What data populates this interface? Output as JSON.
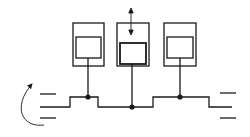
{
  "diagram": {
    "stroke_color": "#1a1a1a",
    "background": "#ffffff",
    "units": [
      {
        "name": "unit-left",
        "outer": {
          "x": 73,
          "y": 23,
          "w": 31,
          "h": 43
        },
        "inner": {
          "x": 76,
          "y": 37,
          "w": 25,
          "h": 21
        },
        "stem_x": 88,
        "junction_y": 97
      },
      {
        "name": "unit-middle",
        "outer": {
          "x": 117,
          "y": 23,
          "w": 32,
          "h": 43
        },
        "inner": {
          "x": 120,
          "y": 43,
          "w": 26,
          "h": 21
        },
        "stem_x": 132,
        "junction_y": 107
      },
      {
        "name": "unit-right",
        "outer": {
          "x": 164,
          "y": 23,
          "w": 32,
          "h": 43
        },
        "inner": {
          "x": 167,
          "y": 37,
          "w": 26,
          "h": 21
        },
        "stem_x": 180,
        "junction_y": 97
      }
    ],
    "bus_path": "M40,107 L70,107 L70,97 L98,97 L98,107 L153,107 L153,97 L209,97 L209,107 L232,107",
    "vertical_arrow": {
      "x": 131,
      "y1": 9,
      "y2": 34
    },
    "left_lines_y": [
      94,
      118
    ],
    "right_lines_y": [
      93,
      118
    ],
    "rotation_arrow": "M44,125 C22,127 12,108 33,83"
  }
}
